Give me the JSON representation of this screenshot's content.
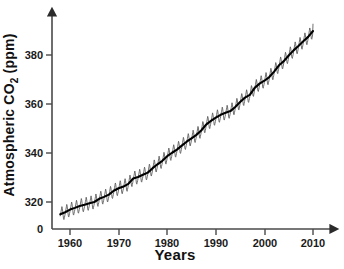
{
  "chart_data": {
    "type": "line",
    "title": "",
    "xlabel": "Years",
    "ylabel_text": "Atmospheric CO",
    "ylabel_sub": "2",
    "ylabel_unit": " (ppm)",
    "ylabel_full": "Atmospheric CO2 (ppm)",
    "xlim": [
      1956,
      2012
    ],
    "ylim": [
      310,
      395
    ],
    "y_axis_break": true,
    "grid": false,
    "legend": "none",
    "xticks": [
      1960,
      1970,
      1980,
      1990,
      2000,
      2010
    ],
    "xtick_labels": [
      "1960",
      "1970",
      "1980",
      "1990",
      "2000",
      "2010"
    ],
    "yticks": [
      320,
      340,
      360,
      380
    ],
    "ytick_labels": [
      "320",
      "340",
      "360",
      "380"
    ],
    "origin_label": "0",
    "series": [
      {
        "name": "Monthly mean CO2 (Mauna Loa)",
        "color": "#555555",
        "description": "seasonal sawtooth oscillation about the trend, amplitude approx 3 ppm peak-to-trough",
        "seasonal_amplitude": 3.1
      },
      {
        "name": "Annual trend",
        "color": "#000000",
        "x": [
          1958,
          1959,
          1960,
          1961,
          1962,
          1963,
          1964,
          1965,
          1966,
          1967,
          1968,
          1969,
          1970,
          1971,
          1972,
          1973,
          1974,
          1975,
          1976,
          1977,
          1978,
          1979,
          1980,
          1981,
          1982,
          1983,
          1984,
          1985,
          1986,
          1987,
          1988,
          1989,
          1990,
          1991,
          1992,
          1993,
          1994,
          1995,
          1996,
          1997,
          1998,
          1999,
          2000,
          2001,
          2002,
          2003,
          2004,
          2005,
          2006,
          2007,
          2008,
          2009,
          2010
        ],
        "values": [
          315.0,
          315.8,
          316.9,
          317.6,
          318.4,
          318.9,
          319.5,
          320.0,
          321.3,
          322.1,
          323.0,
          324.6,
          325.6,
          326.3,
          327.4,
          329.6,
          330.2,
          331.1,
          332.0,
          333.8,
          335.4,
          336.8,
          338.7,
          340.1,
          341.4,
          343.0,
          344.6,
          346.0,
          347.4,
          349.2,
          351.6,
          353.1,
          354.4,
          355.6,
          356.4,
          357.1,
          358.8,
          360.8,
          362.6,
          363.7,
          366.6,
          368.3,
          369.5,
          371.0,
          373.2,
          375.8,
          377.5,
          379.8,
          381.9,
          383.7,
          385.6,
          387.4,
          389.8
        ]
      }
    ]
  },
  "figure": {
    "background_color": "#ffffff",
    "axis_color": "#3a3a3a",
    "trend_color": "#000000",
    "seasonal_color": "#606060"
  }
}
